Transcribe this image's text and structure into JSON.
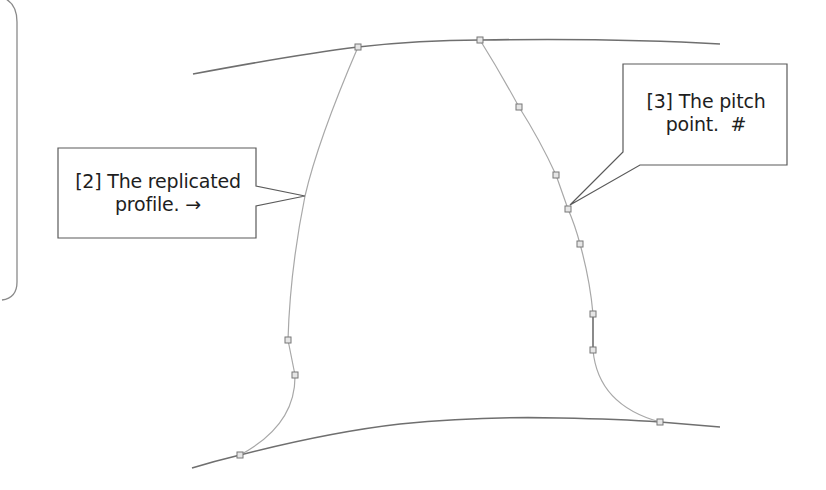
{
  "diagram": {
    "type": "gear tooth profile (CAD sketch)",
    "colors": {
      "arc": "#6f6f6f",
      "profile": "#a8a8a8",
      "marker": "#7a7a7a",
      "callout_border": "#5a5a5a",
      "text": "#1e1e1e",
      "background": "#ffffff"
    },
    "callouts": [
      {
        "id": "2",
        "line1": "[2] The replicated",
        "line2": "profile. →",
        "target": "replicated-profile"
      },
      {
        "id": "3",
        "line1": "[3] The pitch",
        "line2": "point.  #",
        "target": "pitch-point"
      }
    ],
    "markers": {
      "left_profile": [
        [
          358,
          47
        ],
        [
          288,
          340
        ],
        [
          295,
          375
        ],
        [
          240,
          455
        ]
      ],
      "right_profile": [
        [
          480,
          40
        ],
        [
          519,
          107
        ],
        [
          556,
          175
        ],
        [
          568,
          209
        ],
        [
          580,
          244
        ],
        [
          593,
          314
        ],
        [
          593,
          350
        ],
        [
          660,
          422
        ]
      ]
    }
  }
}
